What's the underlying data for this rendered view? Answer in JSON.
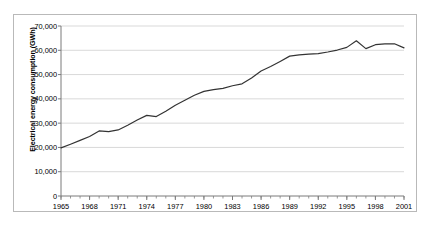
{
  "chart_data": {
    "type": "line",
    "title": "",
    "xlabel": "",
    "ylabel": "Electrical energy consumption (GWh)",
    "xlim": [
      1965,
      2001
    ],
    "ylim": [
      0,
      70000
    ],
    "grid": true,
    "legend": null,
    "y_ticks": [
      0,
      10000,
      20000,
      30000,
      40000,
      50000,
      60000,
      70000
    ],
    "y_tick_labels": [
      "0",
      "10,000",
      "20,000",
      "30,000",
      "40,000",
      "50,000",
      "60,000",
      "70,000"
    ],
    "x_ticks": [
      1965,
      1968,
      1971,
      1974,
      1977,
      1980,
      1983,
      1986,
      1989,
      1992,
      1995,
      1998,
      2001
    ],
    "x_tick_labels": [
      "1965",
      "1968",
      "1971",
      "1974",
      "1977",
      "1980",
      "1983",
      "1986",
      "1989",
      "1992",
      "1995",
      "1998",
      "2001"
    ],
    "x_minor_tick_interval": 1,
    "line_color": "#333333",
    "x": [
      1965,
      1966,
      1967,
      1968,
      1969,
      1970,
      1971,
      1972,
      1973,
      1974,
      1975,
      1976,
      1977,
      1978,
      1979,
      1980,
      1981,
      1982,
      1983,
      1984,
      1985,
      1986,
      1987,
      1988,
      1989,
      1990,
      1991,
      1992,
      1993,
      1994,
      1995,
      1996,
      1997,
      1998,
      1999,
      2000,
      2001
    ],
    "values": [
      19800,
      21300,
      22900,
      24500,
      26800,
      26500,
      27200,
      29100,
      31300,
      33200,
      32700,
      34900,
      37400,
      39400,
      41500,
      43100,
      43800,
      44300,
      45400,
      46200,
      48600,
      51500,
      53300,
      55400,
      57600,
      58100,
      58400,
      58600,
      59300,
      60100,
      61200,
      63900,
      60700,
      62300,
      62600,
      62700,
      61000
    ]
  }
}
